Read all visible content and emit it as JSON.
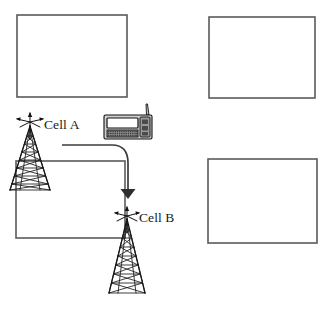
{
  "diagram": {
    "type": "network-handover-diagram",
    "background_color": "#ffffff",
    "line_color": "#1a1a1a",
    "box_stroke_color": "#5a5a5a",
    "arrow_color": "#2e2e2e"
  },
  "labels": {
    "cell_a": "Cell A",
    "cell_b": "Cell B"
  },
  "cells": [
    {
      "id": "cell-top-left",
      "label": "",
      "x": 17,
      "y": 15,
      "width": 110,
      "height": 82
    },
    {
      "id": "cell-top-right",
      "label": "",
      "x": 209,
      "y": 17,
      "width": 106,
      "height": 81
    },
    {
      "id": "cell-bottom-left",
      "label": "",
      "x": 16,
      "y": 161,
      "width": 109,
      "height": 77
    },
    {
      "id": "cell-bottom-right",
      "label": "",
      "x": 208,
      "y": 159,
      "width": 109,
      "height": 84
    }
  ],
  "towers": [
    {
      "id": "tower-cell-a",
      "label": "Cell A",
      "apex_x": 30,
      "apex_y": 126,
      "base_y": 190,
      "half_width": 20,
      "rungs": 9
    },
    {
      "id": "tower-cell-b",
      "label": "Cell B",
      "apex_x": 127,
      "apex_y": 219,
      "base_y": 293,
      "half_width": 18,
      "rungs": 9
    }
  ],
  "antennas": [
    {
      "id": "antenna-cell-a",
      "x": 30,
      "y": 122,
      "rays": 5
    },
    {
      "id": "antenna-cell-b",
      "x": 127,
      "y": 216,
      "rays": 5
    }
  ],
  "device": {
    "id": "mobile-communicator",
    "name": "pda-phone-device",
    "x": 104,
    "y": 115,
    "width": 48,
    "height": 24,
    "has_screen": true,
    "has_keypad": true,
    "has_antenna": true,
    "keypad_rows": 3,
    "keypad_cols": 14
  },
  "flow": {
    "id": "handover-arrow",
    "name": "handover-flow-arrow",
    "from": "Cell A",
    "to": "Cell B",
    "start": {
      "x": 62,
      "y": 145
    },
    "end": {
      "x": 128,
      "y": 198
    },
    "direction": "down"
  }
}
